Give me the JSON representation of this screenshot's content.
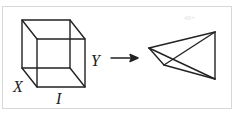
{
  "diagram": {
    "labels": {
      "x": "X",
      "y": "Y",
      "i": "I"
    },
    "watermark": "40+",
    "colors": {
      "stroke": "#222222",
      "border": "#d8d8d8"
    },
    "cube": {
      "vertices": {
        "back_top_left": [
          22,
          20
        ],
        "back_top_right": [
          70,
          20
        ],
        "front_top_left": [
          37,
          39
        ],
        "front_top_right": [
          85,
          39
        ],
        "back_bottom_left": [
          22,
          68
        ],
        "back_bottom_right": [
          70,
          68
        ],
        "front_bottom_left": [
          37,
          87
        ],
        "front_bottom_right": [
          85,
          87
        ]
      }
    },
    "arrow": {
      "from": [
        111,
        58
      ],
      "to": [
        137,
        58
      ]
    },
    "tetrahedron": {
      "vertices": {
        "left": [
          149,
          48
        ],
        "top_right": [
          215,
          32
        ],
        "bottom_right": [
          215,
          79
        ],
        "inner": [
          164,
          65
        ]
      }
    }
  }
}
